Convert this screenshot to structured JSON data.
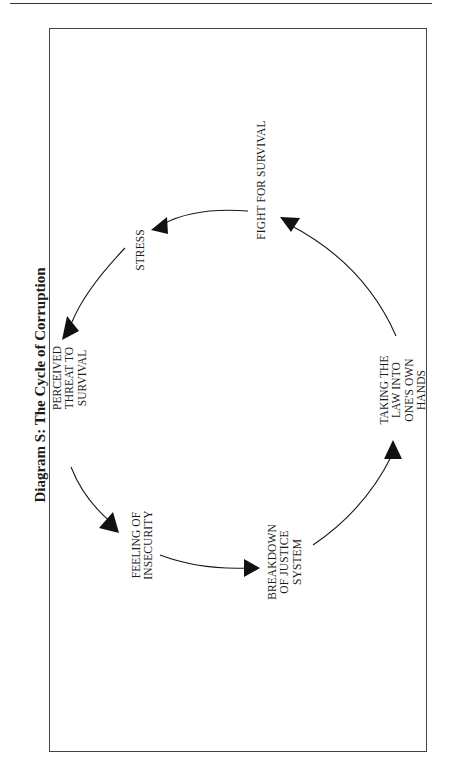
{
  "title": "Diagram S: The Cycle of Corruption",
  "nodes": {
    "stress": {
      "lines": [
        "STRESS"
      ]
    },
    "fight": {
      "lines": [
        "FIGHT FOR SURVIVAL"
      ]
    },
    "perceived": {
      "lines": [
        "PERCEIVED",
        "THREAT TO",
        "SURVIVAL"
      ]
    },
    "insecurity": {
      "lines": [
        "FEELING OF",
        "INSECURITY"
      ]
    },
    "breakdown": {
      "lines": [
        "BREAKDOWN",
        "OF JUSTICE",
        "SYSTEM"
      ]
    },
    "taking": {
      "lines": [
        "TAKING THE",
        "LAW INTO",
        "ONE'S OWN",
        "HANDS"
      ]
    }
  },
  "cycle_order": [
    "stress",
    "perceived",
    "insecurity",
    "breakdown",
    "taking",
    "fight"
  ],
  "colors": {
    "ink": "#1a1a1a",
    "frame": "#444444"
  }
}
